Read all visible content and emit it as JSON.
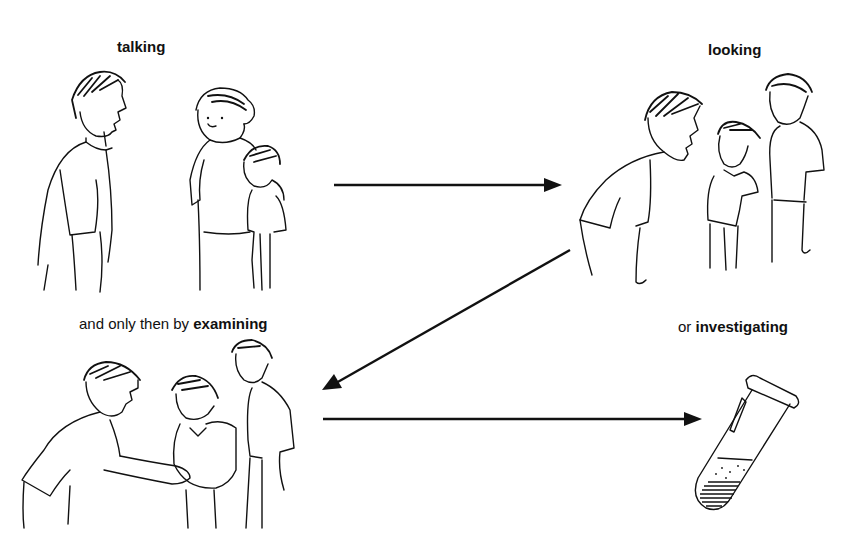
{
  "diagram": {
    "type": "process-flow",
    "steps": [
      {
        "id": "talking",
        "prefix": "",
        "keyword": "talking",
        "illustration": "doctor talking with mother and child"
      },
      {
        "id": "looking",
        "prefix": "",
        "keyword": "looking",
        "illustration": "doctor bending to look at child with mother"
      },
      {
        "id": "examining",
        "prefix": "and only then by ",
        "keyword": "examining",
        "illustration": "doctor examining child's abdomen with mother"
      },
      {
        "id": "investigating",
        "prefix": "or ",
        "keyword": "investigating",
        "illustration": "test tube with sample"
      }
    ],
    "arrows": [
      {
        "from": "talking",
        "to": "looking",
        "direction": "right"
      },
      {
        "from": "looking",
        "to": "examining",
        "direction": "down-left"
      },
      {
        "from": "examining",
        "to": "investigating",
        "direction": "right"
      }
    ],
    "colors": {
      "ink": "#111111",
      "background": "#ffffff"
    }
  }
}
